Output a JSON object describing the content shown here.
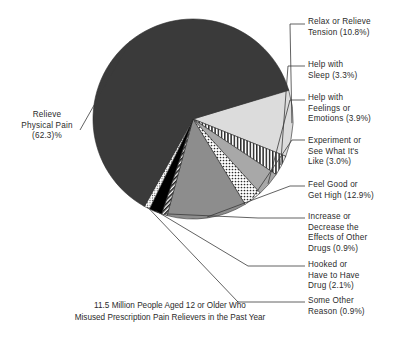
{
  "chart_data": {
    "type": "pie",
    "title": "",
    "subtitle": "",
    "caption": "11.5 Million People Aged 12 or Older Who\nMisused Prescription Pain Relievers in the Past Year",
    "legend_position": "callout-labels",
    "units": "percent",
    "total_label": "11.5 Million People",
    "categories": [
      "Relieve Physical Pain",
      "Relax or Relieve Tension",
      "Help with Sleep",
      "Help with Feelings or Emotions",
      "Experiment or See What It's Like",
      "Feel Good or Get High",
      "Increase or Decrease the Effects of Other Drugs",
      "Hooked or Have to Have Drug",
      "Some Other Reason"
    ],
    "values": [
      62.3,
      10.8,
      3.3,
      3.9,
      3.0,
      12.9,
      0.9,
      2.1,
      0.9
    ],
    "slices": [
      {
        "name": "relieve-physical-pain",
        "label": "Relieve\nPhysical Pain\n(62.3)%",
        "value": 62.3,
        "fill": "#3a3a3a",
        "pattern": "solid"
      },
      {
        "name": "relax-or-relieve-tension",
        "label": "Relax or Relieve\nTension (10.8%)",
        "value": 10.8,
        "fill": "#dcdcdc",
        "pattern": "solid"
      },
      {
        "name": "help-with-sleep",
        "label": "Help with\nSleep (3.3%)",
        "value": 3.3,
        "fill": "#ffffff",
        "pattern": "vertical-hatch"
      },
      {
        "name": "help-with-feelings-or-emotions",
        "label": "Help with\nFeelings or\nEmotions (3.9%)",
        "value": 3.9,
        "fill": "#a8a8a8",
        "pattern": "solid"
      },
      {
        "name": "experiment-or-see-what-its-like",
        "label": "Experiment or\nSee What It's\nLike (3.0%)",
        "value": 3.0,
        "fill": "#ffffff",
        "pattern": "dotted"
      },
      {
        "name": "feel-good-or-get-high",
        "label": "Feel Good or\nGet High (12.9%)",
        "value": 12.9,
        "fill": "#8d8d8d",
        "pattern": "solid"
      },
      {
        "name": "increase-or-decrease-effects-of-other-drugs",
        "label": "Increase or\nDecrease the\nEffects of Other\nDrugs (0.9%)",
        "value": 0.9,
        "fill": "#ffffff",
        "pattern": "diagonal-hatch"
      },
      {
        "name": "hooked-or-have-to-have-drug",
        "label": "Hooked or\nHave to Have\nDrug (2.1%)",
        "value": 2.1,
        "fill": "#000000",
        "pattern": "solid"
      },
      {
        "name": "some-other-reason",
        "label": "Some Other\nReason (0.9%)",
        "value": 0.9,
        "fill": "#ffffff",
        "pattern": "fine-dotted"
      }
    ]
  }
}
